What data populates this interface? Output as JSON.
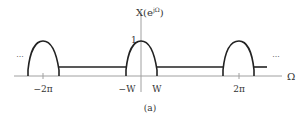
{
  "figure": {
    "y_label": "X(e",
    "y_label_sup": "jΩ",
    "y_label_close": ")",
    "x_label": "Ω",
    "peak_label": "1",
    "ticks": {
      "neg_2pi": "−2π",
      "neg_w": "−W",
      "w": "W",
      "pos_2pi": "2π"
    },
    "ellipsis_left": "···",
    "ellipsis_right": "···",
    "caption": "(a)",
    "colors": {
      "curve": "#222222",
      "axis": "#999999",
      "text": "#333333"
    }
  }
}
